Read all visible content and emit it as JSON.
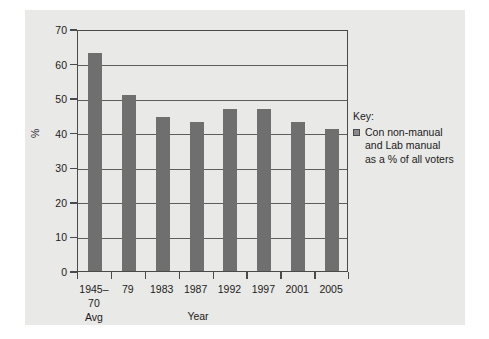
{
  "chart_data": {
    "type": "bar",
    "title": "",
    "xlabel": "Year",
    "ylabel": "%",
    "ylim": [
      0,
      70
    ],
    "ytick_step": 10,
    "grid": true,
    "legend_position": "right",
    "bar_color": "#6f6f6f",
    "panel_color": "#e9e9e7",
    "categories": [
      "1945–70 Avg",
      "1979",
      "1983",
      "1987",
      "1992",
      "1997",
      "2001",
      "2005"
    ],
    "category_lines": [
      [
        "1945–",
        "70",
        "Avg"
      ],
      [
        "79",
        "",
        ""
      ],
      [
        "1983",
        "",
        ""
      ],
      [
        "1987",
        "",
        ""
      ],
      [
        "1992",
        "",
        ""
      ],
      [
        "1997",
        "",
        ""
      ],
      [
        "2001",
        "",
        ""
      ],
      [
        "2005",
        "",
        ""
      ]
    ],
    "values": [
      63,
      51,
      44.5,
      43,
      47,
      47,
      43,
      41
    ],
    "ytick_labels": [
      "0",
      "10",
      "20",
      "30",
      "40",
      "50",
      "60",
      "70"
    ],
    "series": [
      {
        "name": "Con non-manual and Lab manual as a % of all voters",
        "values": [
          63,
          51,
          44.5,
          43,
          47,
          47,
          43,
          41
        ]
      }
    ]
  },
  "axes": {
    "y_title": "%",
    "x_title": "Year"
  },
  "legend": {
    "title": "Key:",
    "line1": "Con non-manual",
    "line2": "and Lab manual",
    "line3": "as a % of all voters"
  }
}
